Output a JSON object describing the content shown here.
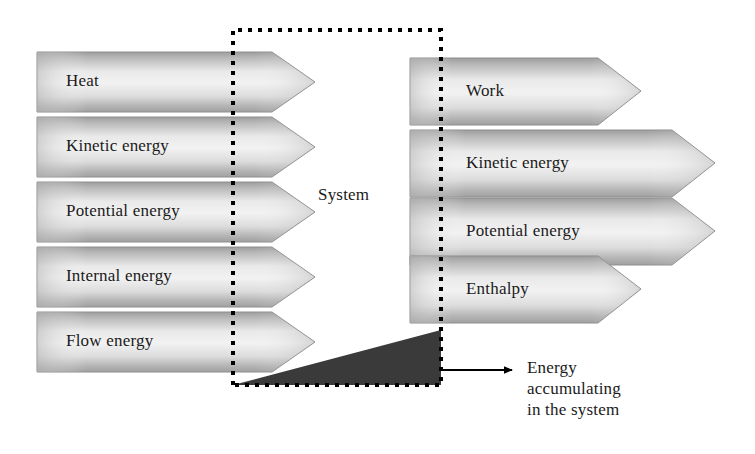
{
  "figure": {
    "system_label": "System",
    "accumulation_label": "Energy accumulating in the system",
    "accumulation_lines": [
      "Energy",
      "accumulating",
      "in the system"
    ]
  },
  "colors": {
    "arrow_edge_dark": "#9a9a9a",
    "arrow_mid_light": "#ededed",
    "arrow_outline": "#8c8c8c",
    "accumulation_fill": "#3a3a3a",
    "boundary_line": "#000000",
    "text": "#1a1a1a",
    "background": "#ffffff"
  },
  "system_boundary": {
    "style": "dotted",
    "x": 233,
    "y": 30,
    "width": 208,
    "height": 355
  },
  "inputs": {
    "heading": "Energy in",
    "arrows": [
      {
        "label": "Heat",
        "y": 52,
        "height": 60,
        "body_end": 272,
        "tip": 315
      },
      {
        "label": "Kinetic energy",
        "y": 117,
        "height": 60,
        "body_end": 272,
        "tip": 315
      },
      {
        "label": "Potential energy",
        "y": 182,
        "height": 60,
        "body_end": 272,
        "tip": 315
      },
      {
        "label": "Internal energy",
        "y": 247,
        "height": 60,
        "body_end": 272,
        "tip": 315
      },
      {
        "label": "Flow energy",
        "y": 312,
        "height": 60,
        "body_end": 272,
        "tip": 315
      }
    ],
    "x": 37,
    "text_x": 66
  },
  "outputs": {
    "heading": "Energy out",
    "arrows": [
      {
        "label": "Work",
        "y": 58,
        "height": 67,
        "body_end": 598,
        "tip": 641
      },
      {
        "label": "Kinetic energy",
        "y": 130,
        "height": 67,
        "body_end": 672,
        "tip": 715
      },
      {
        "label": "Potential energy",
        "y": 198,
        "height": 67,
        "body_end": 672,
        "tip": 715
      },
      {
        "label": "Enthalpy",
        "y": 256,
        "height": 67,
        "body_end": 598,
        "tip": 641
      }
    ],
    "x": 410,
    "text_x": 465
  },
  "accumulation": {
    "triangle": {
      "x1": 233,
      "y1": 385,
      "x2": 441,
      "y2": 330,
      "x3": 441,
      "y3": 385
    },
    "arrow": {
      "x_start": 441,
      "x_end": 518,
      "y": 370
    },
    "text_x": 527,
    "text_y": 358
  }
}
